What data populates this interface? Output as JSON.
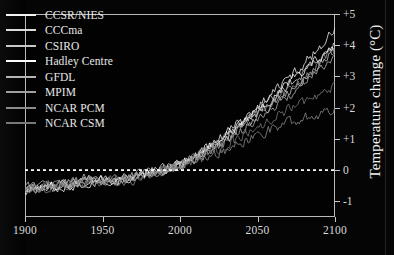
{
  "chart_data": {
    "type": "line",
    "title": "",
    "xlabel": "",
    "ylabel": "Temperature change (°C)",
    "xlim": [
      1900,
      2100
    ],
    "ylim": [
      -1.5,
      5
    ],
    "grid": false,
    "legend_position": "top-left",
    "x_ticks": [
      "1900",
      "1950",
      "2000",
      "2050",
      "2100"
    ],
    "x_tick_values": [
      1900,
      1950,
      2000,
      2050,
      2100
    ],
    "y_ticks": [
      "+5",
      "+4",
      "+3",
      "+2",
      "+1",
      "0",
      "-1"
    ],
    "y_tick_values": [
      5,
      4,
      3,
      2,
      1,
      0,
      -1
    ],
    "reference_line": {
      "value": 0,
      "style": "dashed",
      "color": "#ffffff"
    },
    "x": [
      1900,
      1910,
      1920,
      1930,
      1940,
      1950,
      1960,
      1970,
      1980,
      1990,
      2000,
      2010,
      2020,
      2030,
      2040,
      2050,
      2060,
      2070,
      2080,
      2090,
      2100
    ],
    "series": [
      {
        "name": "CCSR/NIES",
        "color": "#f2f2f2",
        "values": [
          -0.55,
          -0.6,
          -0.5,
          -0.45,
          -0.3,
          -0.35,
          -0.3,
          -0.25,
          -0.15,
          0.0,
          0.15,
          0.45,
          0.8,
          1.2,
          1.6,
          2.05,
          2.5,
          2.95,
          3.4,
          3.95,
          4.5
        ]
      },
      {
        "name": "CCCma",
        "color": "#dcdcdc",
        "values": [
          -0.6,
          -0.55,
          -0.55,
          -0.4,
          -0.35,
          -0.4,
          -0.3,
          -0.3,
          -0.1,
          0.05,
          0.2,
          0.4,
          0.75,
          1.1,
          1.5,
          1.9,
          2.3,
          2.75,
          3.15,
          3.6,
          4.05
        ]
      },
      {
        "name": "CSIRO",
        "color": "#c8c8c8",
        "values": [
          -0.5,
          -0.55,
          -0.45,
          -0.45,
          -0.25,
          -0.3,
          -0.35,
          -0.2,
          -0.1,
          0.0,
          0.18,
          0.42,
          0.7,
          1.0,
          1.4,
          1.75,
          2.15,
          2.55,
          2.95,
          3.35,
          3.8
        ]
      },
      {
        "name": "Hadley Centre",
        "color": "#ffffff",
        "values": [
          -0.65,
          -0.6,
          -0.5,
          -0.5,
          -0.35,
          -0.35,
          -0.3,
          -0.25,
          -0.12,
          0.02,
          0.22,
          0.48,
          0.82,
          1.15,
          1.55,
          1.95,
          2.35,
          2.8,
          3.2,
          3.6,
          4.0
        ]
      },
      {
        "name": "GFDL",
        "color": "#b4b4b4",
        "values": [
          -0.55,
          -0.5,
          -0.55,
          -0.42,
          -0.3,
          -0.38,
          -0.28,
          -0.22,
          -0.08,
          0.04,
          0.16,
          0.38,
          0.65,
          0.95,
          1.3,
          1.65,
          2.0,
          2.4,
          2.8,
          3.2,
          3.6
        ]
      },
      {
        "name": "MPIM",
        "color": "#a0a0a0",
        "values": [
          -0.6,
          -0.58,
          -0.48,
          -0.44,
          -0.32,
          -0.32,
          -0.32,
          -0.24,
          -0.1,
          0.0,
          0.2,
          0.44,
          0.72,
          1.05,
          1.42,
          1.8,
          2.2,
          2.6,
          3.0,
          3.4,
          3.85
        ]
      },
      {
        "name": "NCAR PCM",
        "color": "#8c8c8c",
        "values": [
          -0.62,
          -0.6,
          -0.52,
          -0.48,
          -0.38,
          -0.4,
          -0.35,
          -0.3,
          -0.18,
          -0.05,
          0.08,
          0.25,
          0.45,
          0.68,
          0.9,
          1.12,
          1.35,
          1.55,
          1.7,
          1.8,
          1.95
        ]
      },
      {
        "name": "NCAR CSM",
        "color": "#787878",
        "values": [
          -0.58,
          -0.56,
          -0.5,
          -0.46,
          -0.36,
          -0.36,
          -0.33,
          -0.28,
          -0.14,
          -0.02,
          0.12,
          0.3,
          0.55,
          0.82,
          1.1,
          1.4,
          1.68,
          1.95,
          2.2,
          2.45,
          2.7
        ]
      }
    ]
  },
  "legend": {
    "items": [
      {
        "label": "CCSR/NIES",
        "color": "#f2f2f2"
      },
      {
        "label": "CCCma",
        "color": "#dcdcdc"
      },
      {
        "label": "CSIRO",
        "color": "#c8c8c8"
      },
      {
        "label": "Hadley Centre",
        "color": "#ffffff"
      },
      {
        "label": "GFDL",
        "color": "#b4b4b4"
      },
      {
        "label": "MPIM",
        "color": "#a0a0a0"
      },
      {
        "label": "NCAR PCM",
        "color": "#8c8c8c"
      },
      {
        "label": "NCAR CSM",
        "color": "#787878"
      }
    ]
  },
  "axes": {
    "y_title": "Temperature change (°C)",
    "x_tick_labels": [
      "1900",
      "1950",
      "2000",
      "2050",
      "2100"
    ],
    "y_tick_labels": [
      "+5",
      "+4",
      "+3",
      "+2",
      "+1",
      "0",
      "-1"
    ]
  },
  "colors": {
    "background": "#050505",
    "axis": "#b9b9b9",
    "text": "#e0e0e0",
    "zero_line": "#ffffff"
  }
}
